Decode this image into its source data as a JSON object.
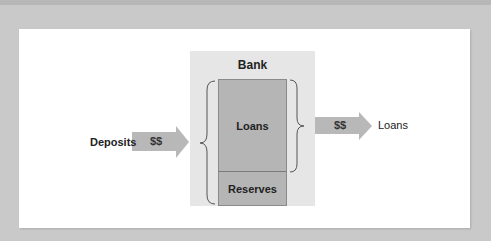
{
  "diagram": {
    "bank": {
      "title": "Bank",
      "sections": [
        {
          "label": "Loans"
        },
        {
          "label": "Reserves"
        }
      ]
    },
    "inflow": {
      "source_label": "Deposits",
      "arrow_label": "$$"
    },
    "outflow": {
      "arrow_label": "$$",
      "destination_label": "Loans"
    },
    "colors": {
      "background": "#c9c9c9",
      "panel": "#ffffff",
      "bank_box": "#e6e6e6",
      "section_fill": "#b5b5b5",
      "arrow_fill": "#b8b8b8",
      "brace_stroke": "#555555"
    }
  }
}
